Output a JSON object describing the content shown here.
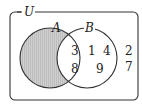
{
  "diagram": {
    "type": "venn",
    "universal_label": "U",
    "sets": [
      {
        "name": "A",
        "label": "A",
        "shaded": "A minus B"
      },
      {
        "name": "B",
        "label": "B"
      }
    ],
    "regions": {
      "A_only": [],
      "A_and_B": [
        "3",
        "8"
      ],
      "B_only": [
        "1",
        "4",
        "9"
      ],
      "outside": [
        "2",
        "7"
      ]
    },
    "colors": {
      "shade": "#c8c8c8",
      "stroke": "#333333"
    }
  }
}
